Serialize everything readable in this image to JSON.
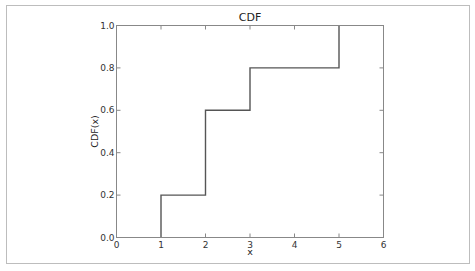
{
  "chart_data": {
    "type": "line",
    "style": "step",
    "title": "CDF",
    "xlabel": "x",
    "ylabel": "CDF(x)",
    "xlim": [
      0,
      6
    ],
    "ylim": [
      0.0,
      1.0
    ],
    "xticks": [
      0,
      1,
      2,
      3,
      4,
      5,
      6
    ],
    "xtick_labels": [
      "0",
      "1",
      "2",
      "3",
      "4",
      "5",
      "6"
    ],
    "yticks": [
      0.0,
      0.2,
      0.4,
      0.6,
      0.8,
      1.0
    ],
    "ytick_labels": [
      "0.0",
      "0.2",
      "0.4",
      "0.6",
      "0.8",
      "1.0"
    ],
    "grid": false,
    "series": [
      {
        "name": "CDF",
        "color": "#555555",
        "x": [
          1,
          1,
          2,
          2,
          3,
          3,
          5,
          5
        ],
        "y": [
          0.0,
          0.2,
          0.2,
          0.6,
          0.6,
          0.8,
          0.8,
          1.0
        ]
      }
    ]
  }
}
